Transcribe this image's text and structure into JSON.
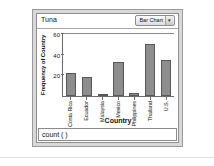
{
  "window": {
    "collection_title": "Tuna",
    "chart_type_label": "Bar Chart",
    "chart_type_arrow": "▾"
  },
  "formula": {
    "text": "count ( )"
  },
  "colors": {
    "bar_fill": "#8d8d8d",
    "bar_stroke": "#585858",
    "axis": "#6d6d6d",
    "window_frame": "#d8d8d8",
    "plot_background": "#ffffff"
  },
  "chart_data": {
    "type": "bar",
    "title": "Tuna",
    "xlabel": "Country",
    "ylabel": "Frequency of Country",
    "categories": [
      "Costa Rica",
      "Ecuador",
      "Malaysia",
      "Mexico",
      "Philippines",
      "Thailand",
      "U.S."
    ],
    "values": [
      22,
      18,
      2,
      33,
      3,
      50,
      35
    ],
    "yticks": [
      20,
      40,
      60
    ],
    "ytick_labels": [
      "20",
      "40",
      "60"
    ],
    "ylim": [
      0,
      62
    ],
    "grid": false,
    "legend": null
  }
}
